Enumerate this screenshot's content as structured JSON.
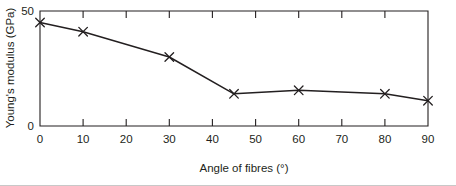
{
  "chart_data": {
    "type": "line",
    "title": "",
    "subtitle": "",
    "xlabel": "Angle of fibres (°)",
    "ylabel": "Young's modulus (GPa)",
    "xlim": [
      0,
      90
    ],
    "ylim": [
      0,
      50
    ],
    "grid": false,
    "legend": null,
    "marker": "x",
    "line_color": "#231f20",
    "x": [
      0,
      10,
      30,
      45,
      60,
      80,
      90
    ],
    "y": [
      45,
      41,
      30,
      14,
      15.5,
      14,
      11
    ],
    "series": [
      {
        "name": "Young's modulus",
        "x": [
          0,
          10,
          30,
          45,
          60,
          80,
          90
        ],
        "values": [
          45,
          41,
          30,
          14,
          15.5,
          14,
          11
        ]
      }
    ],
    "x_ticks": [
      0,
      10,
      20,
      30,
      40,
      50,
      60,
      70,
      80,
      90
    ],
    "x_tick_labels": [
      "0",
      "10",
      "20",
      "30",
      "40",
      "50",
      "60",
      "70",
      "80",
      "90"
    ],
    "y_ticks": [
      0,
      50
    ],
    "y_tick_labels": [
      "0",
      "50"
    ],
    "annotations": []
  },
  "axes": {
    "y_label": "Young's modulus (GPa)",
    "x_label": "Angle of fibres (°)",
    "y_top_label": "50",
    "y_bottom_label": "0"
  },
  "x_tick_labels": {
    "t0": "0",
    "t1": "10",
    "t2": "20",
    "t3": "30",
    "t4": "40",
    "t5": "50",
    "t6": "60",
    "t7": "70",
    "t8": "80",
    "t9": "90"
  },
  "colors": {
    "ink": "#231f20",
    "background": "#ffffff",
    "footer_rule": "#c8c8c8"
  }
}
